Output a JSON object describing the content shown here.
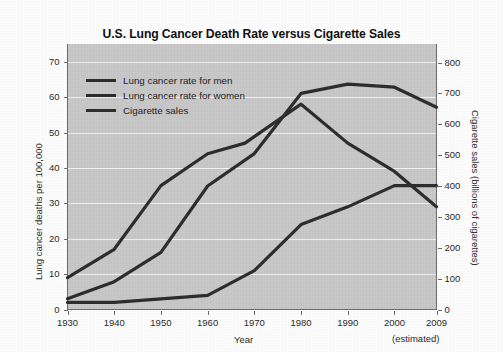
{
  "chart_data": {
    "type": "line",
    "title": "U.S. Lung Cancer Death Rate versus Cigarette Sales",
    "xlabel": "Year",
    "ylabel": "Lung cancer deaths per 100,000",
    "y2label": "Cigarette sales (billions of cigarettes)",
    "x": [
      1930,
      1940,
      1950,
      1960,
      1970,
      1980,
      1990,
      2000,
      2009
    ],
    "xtick_labels": [
      "1930",
      "1940",
      "1950",
      "1960",
      "1970",
      "1980",
      "1990",
      "2000",
      "2009"
    ],
    "xtick_sublabel": "(estimated)",
    "xlim": [
      1930,
      2009
    ],
    "ylim": [
      0,
      75
    ],
    "y2lim": [
      0,
      860
    ],
    "yticks": [
      0,
      10,
      20,
      30,
      40,
      50,
      60,
      70
    ],
    "ytick_labels": [
      "0",
      "10",
      "20",
      "30",
      "40",
      "50",
      "60",
      "70"
    ],
    "y2ticks": [
      0,
      100,
      200,
      300,
      400,
      500,
      600,
      700,
      800
    ],
    "y2tick_labels": [
      "0",
      "100",
      "200",
      "300",
      "400",
      "500",
      "600",
      "700",
      "800"
    ],
    "grid": "horizontal",
    "legend_position": "upper-left-inside",
    "plot_background": "#c9c9c9",
    "gridline_color": "#f2f2f2",
    "line_color": "#2e2e2e",
    "series": [
      {
        "name": "Lung cancer rate for men",
        "axis": "left",
        "color": "#2e2e2e",
        "x": [
          1930,
          1940,
          1950,
          1960,
          1970,
          1980,
          1990,
          2000,
          2005,
          2009
        ],
        "values": [
          9,
          17,
          35,
          44,
          47,
          58,
          47,
          39,
          34,
          29
        ]
      },
      {
        "name": "Lung cancer rate for women",
        "axis": "left",
        "color": "#2e2e2e",
        "x": [
          1930,
          1940,
          1950,
          1960,
          1970,
          1980,
          1990,
          2000,
          2005,
          2009
        ],
        "values": [
          3,
          8,
          16,
          22,
          35,
          47,
          62,
          63,
          58,
          57
        ]
      },
      {
        "name": "Cigarette sales",
        "axis": "right",
        "color": "#2e2e2e",
        "x": [
          1930,
          1940,
          1950,
          1960,
          1970,
          1980,
          1990,
          2000,
          2005,
          2009
        ],
        "values": [
          20,
          20,
          40,
          50,
          125,
          265,
          330,
          395,
          395,
          395
        ]
      }
    ],
    "curve_men_left_axis": [
      {
        "year": 1930,
        "value": 9
      },
      {
        "year": 1940,
        "value": 17
      },
      {
        "year": 1950,
        "value": 35
      },
      {
        "year": 1960,
        "value": 44
      },
      {
        "year": 1968,
        "value": 47
      },
      {
        "year": 1980,
        "value": 58
      },
      {
        "year": 1990,
        "value": 47
      },
      {
        "year": 2000,
        "value": 39
      },
      {
        "year": 2009,
        "value": 29
      }
    ],
    "curve_women_left_axis": [
      {
        "year": 1930,
        "value": 2
      },
      {
        "year": 1940,
        "value": 2
      },
      {
        "year": 1950,
        "value": 3
      },
      {
        "year": 1960,
        "value": 4
      },
      {
        "year": 1970,
        "value": 11
      },
      {
        "year": 1980,
        "value": 24
      },
      {
        "year": 1990,
        "value": 29
      },
      {
        "year": 2000,
        "value": 35
      },
      {
        "year": 2009,
        "value": 35
      }
    ],
    "curve_cigarette_right_axis": [
      {
        "year": 1930,
        "value": 35
      },
      {
        "year": 1940,
        "value": 90
      },
      {
        "year": 1950,
        "value": 185
      },
      {
        "year": 1960,
        "value": 400
      },
      {
        "year": 1970,
        "value": 505
      },
      {
        "year": 1980,
        "value": 700
      },
      {
        "year": 1990,
        "value": 730
      },
      {
        "year": 2000,
        "value": 720
      },
      {
        "year": 2009,
        "value": 655
      }
    ]
  },
  "legend": {
    "items": [
      {
        "label": "Lung cancer rate for men"
      },
      {
        "label": "Lung cancer rate for women"
      },
      {
        "label": "Cigarette sales"
      }
    ]
  }
}
